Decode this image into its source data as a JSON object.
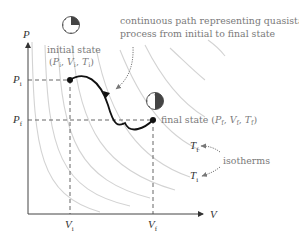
{
  "diagram": {
    "axes": {
      "y_label": "P",
      "x_label": "V",
      "p_initial_label": "P",
      "p_initial_sub": "i",
      "p_final_label": "P",
      "p_final_sub": "f",
      "v_initial_label": "V",
      "v_initial_sub": "i",
      "v_final_label": "V",
      "v_final_sub": "f"
    },
    "initial_state": {
      "title": "initial state",
      "tuple_open": "(",
      "p": "P",
      "p_sub": "i",
      "v": "V",
      "v_sub": "i",
      "t": "T",
      "t_sub": "i",
      "tuple_close": ")",
      "sep": ", "
    },
    "final_state": {
      "title": "final state (",
      "p": "P",
      "p_sub": "f",
      "v": "V",
      "v_sub": "f",
      "t": "T",
      "t_sub": "f",
      "tuple_close": ")",
      "sep": ", "
    },
    "path_note": {
      "line1": "continuous path representing quasistatic",
      "line2": "process from initial to final state"
    },
    "isotherm_labels": {
      "tf": "T",
      "tf_sub": "f",
      "ti": "T",
      "ti_sub": "i",
      "note": "isotherms"
    },
    "icons": {
      "clock_initial": "clock-icon-quarter-elapsed",
      "clock_final": "clock-icon-half-elapsed"
    },
    "colors": {
      "path": "#111111",
      "isotherm": "#d0d0d0",
      "annotation_text": "#7a7a7a",
      "axis": "#555555",
      "dashed_guides": "#555555",
      "clock_fill": "#444444"
    }
  }
}
